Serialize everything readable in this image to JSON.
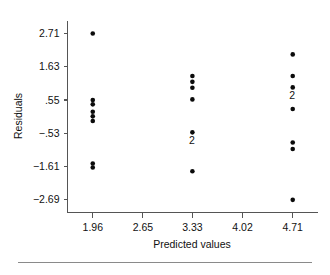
{
  "chart_data": {
    "type": "scatter",
    "title": "",
    "xlabel": "Predicted values",
    "ylabel": "Residuals",
    "xlim": [
      1.6125,
      5.0575
    ],
    "ylim": [
      -3.1,
      3.13
    ],
    "xticks": [
      1.96,
      2.65,
      3.33,
      4.02,
      4.71
    ],
    "xtick_labels": [
      "1.96",
      "2.65",
      "3.33",
      "4.02",
      "4.71"
    ],
    "yticks": [
      2.71,
      1.63,
      0.55,
      -0.53,
      -1.61,
      -2.69
    ],
    "ytick_labels": [
      "2.71",
      "1.63",
      ".55",
      "−.53",
      "−1.61",
      "−2.69"
    ],
    "grid": false,
    "legend": null,
    "marker": "filled-circle",
    "marker_color": "#0b0b0b",
    "marker_size": 4.6,
    "points": [
      {
        "x": 1.96,
        "y": 2.71,
        "count": 1,
        "label": ""
      },
      {
        "x": 1.96,
        "y": 0.55,
        "count": 1,
        "label": ""
      },
      {
        "x": 1.96,
        "y": 0.41,
        "count": 1,
        "label": ""
      },
      {
        "x": 1.96,
        "y": 0.17,
        "count": 1,
        "label": ""
      },
      {
        "x": 1.96,
        "y": 0.02,
        "count": 1,
        "label": ""
      },
      {
        "x": 1.96,
        "y": -0.13,
        "count": 1,
        "label": ""
      },
      {
        "x": 1.96,
        "y": -1.51,
        "count": 1,
        "label": ""
      },
      {
        "x": 1.96,
        "y": -1.64,
        "count": 1,
        "label": ""
      },
      {
        "x": 3.33,
        "y": 1.33,
        "count": 1,
        "label": ""
      },
      {
        "x": 3.33,
        "y": 1.14,
        "count": 1,
        "label": ""
      },
      {
        "x": 3.33,
        "y": 0.95,
        "count": 1,
        "label": ""
      },
      {
        "x": 3.33,
        "y": 0.57,
        "count": 1,
        "label": ""
      },
      {
        "x": 3.33,
        "y": -0.5,
        "count": 2,
        "label": "2"
      },
      {
        "x": 3.33,
        "y": -1.76,
        "count": 1,
        "label": ""
      },
      {
        "x": 4.71,
        "y": 2.03,
        "count": 1,
        "label": ""
      },
      {
        "x": 4.71,
        "y": 1.33,
        "count": 1,
        "label": ""
      },
      {
        "x": 4.71,
        "y": 0.96,
        "count": 2,
        "label": "2"
      },
      {
        "x": 4.71,
        "y": 0.26,
        "count": 1,
        "label": ""
      },
      {
        "x": 4.71,
        "y": -0.83,
        "count": 1,
        "label": ""
      },
      {
        "x": 4.71,
        "y": -1.04,
        "count": 1,
        "label": ""
      },
      {
        "x": 4.71,
        "y": -2.69,
        "count": 1,
        "label": ""
      }
    ]
  }
}
